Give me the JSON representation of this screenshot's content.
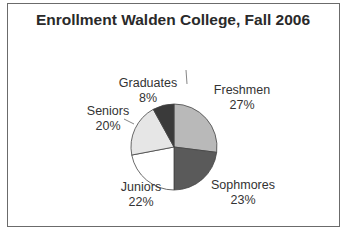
{
  "chart_data": {
    "type": "pie",
    "title": "Enrollment Walden College, Fall 2006",
    "categories": [
      "Freshmen",
      "Sophmores",
      "Juniors",
      "Seniors",
      "Graduates"
    ],
    "values": [
      27,
      23,
      22,
      20,
      8
    ],
    "value_labels": [
      "27%",
      "23%",
      "22%",
      "20%",
      "8%"
    ],
    "colors": [
      "#b9b9b9",
      "#5a5a5a",
      "#ffffff",
      "#e6e6e6",
      "#3a3a3a"
    ],
    "start_angle": "12 o'clock",
    "direction": "clockwise",
    "legend": "none (data labels beside slices)"
  },
  "labels": {
    "freshmen": {
      "name": "Freshmen",
      "pct": "27%"
    },
    "sophmores": {
      "name": "Sophmores",
      "pct": "23%"
    },
    "juniors": {
      "name": "Juniors",
      "pct": "22%"
    },
    "seniors": {
      "name": "Seniors",
      "pct": "20%"
    },
    "graduates": {
      "name": "Graduates",
      "pct": "8%"
    }
  }
}
